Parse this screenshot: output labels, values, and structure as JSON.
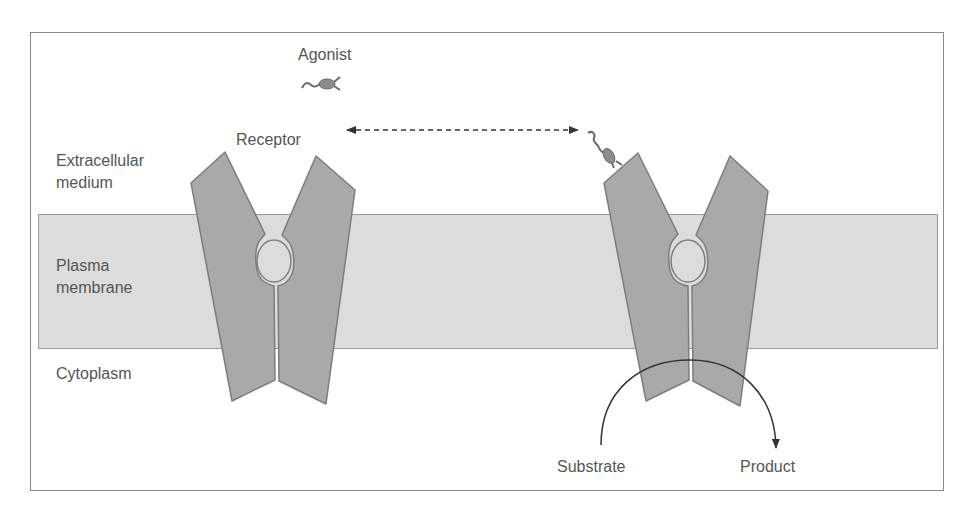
{
  "diagram": {
    "labels": {
      "agonist": "Agonist",
      "receptor": "Receptor",
      "extracellular": "Extracellular\nmedium",
      "plasma_membrane": "Plasma\nmembrane",
      "cytoplasm": "Cytoplasm",
      "substrate": "Substrate",
      "product": "Product"
    },
    "colors": {
      "receptor_fill": "#a9a9a9",
      "receptor_stroke": "#7d7d7d",
      "membrane_fill": "#dcdcdc",
      "membrane_stroke": "#9a9a9a",
      "agonist_fill": "#8c8c8c",
      "text": "#555555",
      "arrow": "#333333"
    },
    "regions": [
      "Extracellular medium",
      "Plasma membrane",
      "Cytoplasm"
    ],
    "components": [
      {
        "name": "Agonist",
        "state": "free"
      },
      {
        "name": "Receptor",
        "state": "inactive"
      },
      {
        "name": "Receptor",
        "state": "agonist-bound, active"
      }
    ],
    "arrows": [
      {
        "from": "Receptor (inactive)",
        "to": "Receptor (agonist-bound)",
        "style": "dashed, bidirectional"
      },
      {
        "from": "Substrate",
        "to": "Product",
        "style": "solid curved"
      }
    ]
  }
}
